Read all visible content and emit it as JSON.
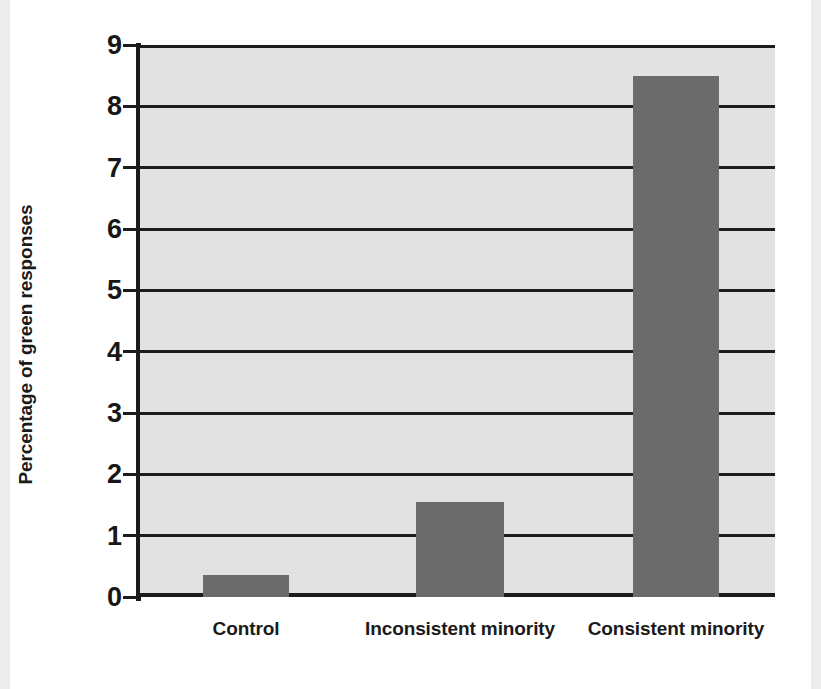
{
  "chart_data": {
    "type": "bar",
    "title": "",
    "subtitle": "",
    "xlabel": "",
    "ylabel": "Percentage of green responses",
    "categories": [
      "Control",
      "Inconsistent minority",
      "Consistent minority"
    ],
    "values": [
      0.36,
      1.55,
      8.5
    ],
    "series": [
      {
        "name": "Percentage of green responses",
        "values": [
          0.36,
          1.55,
          8.5
        ]
      }
    ],
    "ylim": [
      0,
      9
    ],
    "yticks": [
      0,
      1,
      2,
      3,
      4,
      5,
      6,
      7,
      8,
      9
    ],
    "ytick_labels": [
      "0",
      "1",
      "2",
      "3",
      "4",
      "5",
      "6",
      "7",
      "8",
      "9"
    ],
    "grid": true,
    "grid_axis": "y",
    "legend": false,
    "legend_position": "none",
    "annotations": [],
    "colors": {
      "bar_fill": "#6b6b6b",
      "plot_background": "#e2e2e2",
      "gridline": "#1c1c1c",
      "axis": "#1c1c1c",
      "text": "#1a1a1a",
      "figure_background": "#ffffff"
    }
  }
}
